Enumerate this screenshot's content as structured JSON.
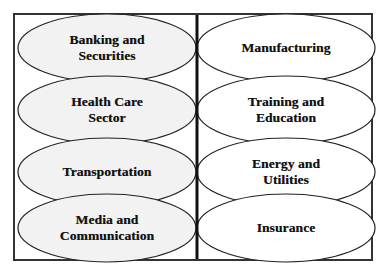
{
  "diagram": {
    "style": {
      "page_background": "#ffffff",
      "frame_border_color": "#333333",
      "ellipse_stroke_color": "#222222",
      "left_ellipse_fill": "#f2f2f2",
      "right_ellipse_fill": "#ffffff",
      "divider_color": "#111111",
      "text_color": "#111111"
    },
    "divider": {
      "name": "vertical-divider",
      "x": 197,
      "y_top": 15,
      "y_bottom": 259,
      "thickness": 3
    },
    "columns": [
      {
        "side": "left",
        "fill": "#f2f2f2",
        "nodes": [
          {
            "id": "banking-and-securities",
            "lines": [
              "Banking and",
              "Securities"
            ],
            "cx": 107,
            "cy": 48,
            "rx": 89,
            "ry": 34
          },
          {
            "id": "health-care-sector",
            "lines": [
              "Health Care",
              "Sector"
            ],
            "cx": 107,
            "cy": 110,
            "rx": 89,
            "ry": 34
          },
          {
            "id": "transportation",
            "lines": [
              "Transportation"
            ],
            "cx": 107,
            "cy": 172,
            "rx": 89,
            "ry": 34
          },
          {
            "id": "media-and-communication",
            "lines": [
              "Media and",
              "Communication"
            ],
            "cx": 107,
            "cy": 228,
            "rx": 89,
            "ry": 34
          }
        ]
      },
      {
        "side": "right",
        "fill": "#ffffff",
        "nodes": [
          {
            "id": "manufacturing",
            "lines": [
              "Manufacturing"
            ],
            "cx": 286,
            "cy": 48,
            "rx": 89,
            "ry": 34
          },
          {
            "id": "training-and-education",
            "lines": [
              "Training and",
              "Education"
            ],
            "cx": 286,
            "cy": 110,
            "rx": 89,
            "ry": 34
          },
          {
            "id": "energy-and-utilities",
            "lines": [
              "Energy and",
              "Utilities"
            ],
            "cx": 286,
            "cy": 172,
            "rx": 89,
            "ry": 34
          },
          {
            "id": "insurance",
            "lines": [
              "Insurance"
            ],
            "cx": 286,
            "cy": 228,
            "rx": 89,
            "ry": 34
          }
        ]
      }
    ],
    "labels": {
      "banking_and_securities_line1": "Banking and",
      "banking_and_securities_line2": "Securities",
      "health_care_sector_line1": "Health Care",
      "health_care_sector_line2": "Sector",
      "transportation_line1": "Transportation",
      "media_and_communication_line1": "Media and",
      "media_and_communication_line2": "Communication",
      "manufacturing_line1": "Manufacturing",
      "training_and_education_line1": "Training and",
      "training_and_education_line2": "Education",
      "energy_and_utilities_line1": "Energy and",
      "energy_and_utilities_line2": "Utilities",
      "insurance_line1": "Insurance"
    }
  }
}
